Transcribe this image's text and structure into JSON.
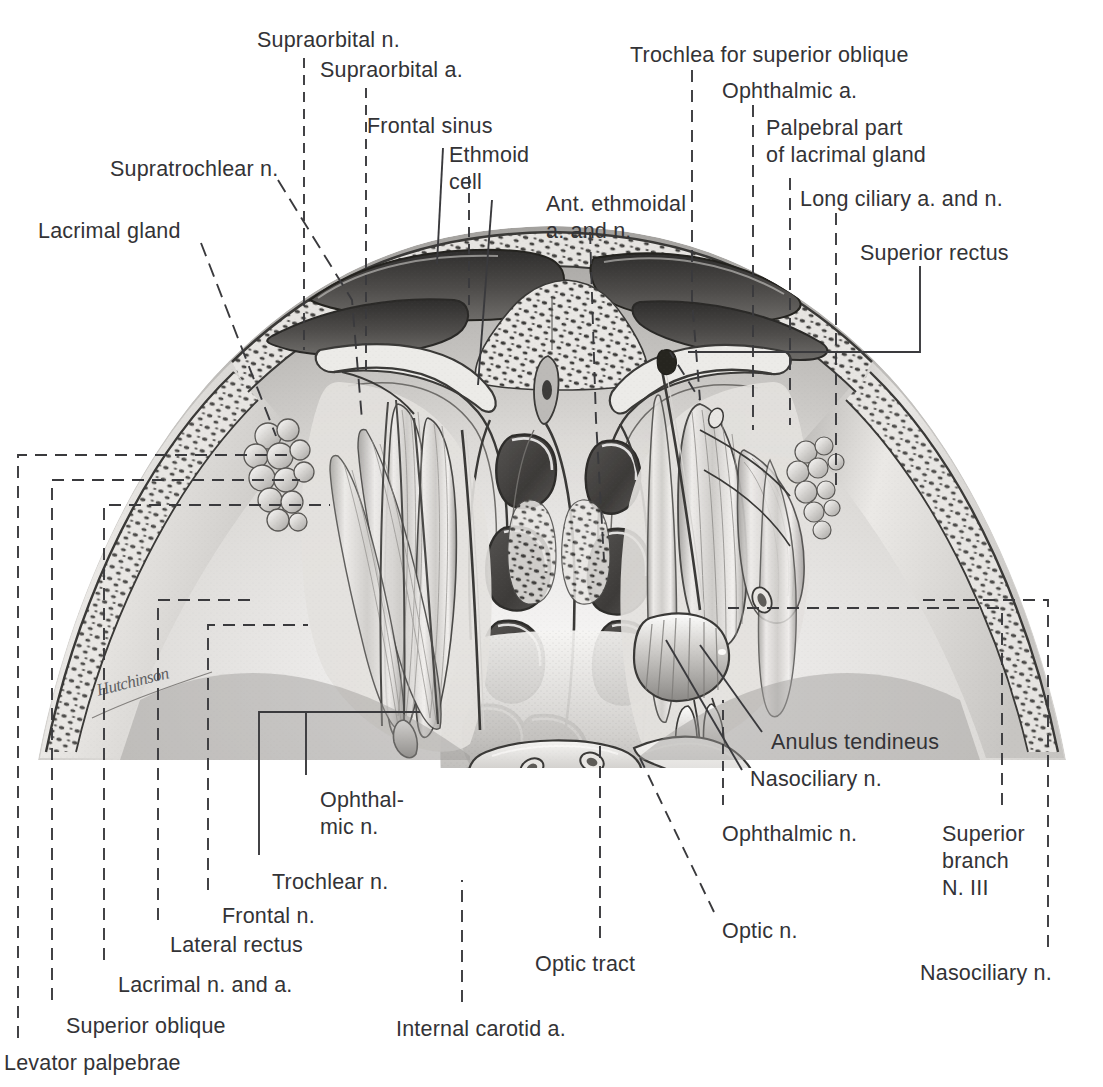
{
  "plate": {
    "title": "Coronal section of the orbits — anatomical plate",
    "artist_signature": "Hutchinson",
    "background_color": "#ffffff",
    "ink_color": "#333336",
    "leader_color": "#3a3a3d"
  },
  "labels": [
    {
      "id": "supraorbital-n",
      "text": "Supraorbital n.",
      "x": 257,
      "y": 27,
      "align": "left"
    },
    {
      "id": "supraorbital-a",
      "text": "Supraorbital a.",
      "x": 320,
      "y": 57,
      "align": "left"
    },
    {
      "id": "frontal-sinus",
      "text": "Frontal sinus",
      "x": 367,
      "y": 113,
      "align": "left"
    },
    {
      "id": "ethmoid-cell",
      "text": "Ethmoid\ncell",
      "x": 449,
      "y": 142,
      "align": "left"
    },
    {
      "id": "supratrochlear-n",
      "text": "Supratrochlear n.",
      "x": 110,
      "y": 156,
      "align": "left"
    },
    {
      "id": "ant-ethmoidal-a-and-n",
      "text": "Ant. ethmoidal\na. and n.",
      "x": 546,
      "y": 191,
      "align": "left"
    },
    {
      "id": "lacrimal-gland",
      "text": "Lacrimal gland",
      "x": 38,
      "y": 218,
      "align": "left"
    },
    {
      "id": "trochlea-superior-oblique",
      "text": "Trochlea for superior oblique",
      "x": 630,
      "y": 42,
      "align": "left"
    },
    {
      "id": "ophthalmic-a",
      "text": "Ophthalmic a.",
      "x": 722,
      "y": 78,
      "align": "left"
    },
    {
      "id": "palpebral-part-lacrimal",
      "text": "Palpebral part\nof lacrimal gland",
      "x": 766,
      "y": 115,
      "align": "left"
    },
    {
      "id": "long-ciliary-a-and-n",
      "text": "Long ciliary a. and n.",
      "x": 800,
      "y": 186,
      "align": "left"
    },
    {
      "id": "superior-rectus",
      "text": "Superior rectus",
      "x": 860,
      "y": 240,
      "align": "left"
    },
    {
      "id": "anulus-tendineus",
      "text": "Anulus tendineus",
      "x": 771,
      "y": 729,
      "align": "left"
    },
    {
      "id": "nasociliary-n-mid",
      "text": "Nasociliary n.",
      "x": 750,
      "y": 766,
      "align": "left"
    },
    {
      "id": "ophthalmic-n-left",
      "text": "Ophthal-\nmic n.",
      "x": 320,
      "y": 787,
      "align": "left"
    },
    {
      "id": "ophthalmic-n-right",
      "text": "Ophthalmic n.",
      "x": 722,
      "y": 821,
      "align": "left"
    },
    {
      "id": "superior-branch-n3",
      "text": "Superior\nbranch\nN. III",
      "x": 942,
      "y": 821,
      "align": "left"
    },
    {
      "id": "trochlear-n",
      "text": "Trochlear n.",
      "x": 272,
      "y": 869,
      "align": "left"
    },
    {
      "id": "frontal-n",
      "text": "Frontal n.",
      "x": 222,
      "y": 903,
      "align": "left"
    },
    {
      "id": "optic-n",
      "text": "Optic n.",
      "x": 722,
      "y": 918,
      "align": "left"
    },
    {
      "id": "lateral-rectus",
      "text": "Lateral rectus",
      "x": 170,
      "y": 932,
      "align": "left"
    },
    {
      "id": "optic-tract",
      "text": "Optic tract",
      "x": 535,
      "y": 951,
      "align": "left"
    },
    {
      "id": "nasociliary-n-bottom",
      "text": "Nasociliary n.",
      "x": 920,
      "y": 960,
      "align": "left"
    },
    {
      "id": "lacrimal-n-and-a",
      "text": "Lacrimal n. and a.",
      "x": 118,
      "y": 972,
      "align": "left"
    },
    {
      "id": "superior-oblique",
      "text": "Superior oblique",
      "x": 66,
      "y": 1013,
      "align": "left"
    },
    {
      "id": "internal-carotid-a",
      "text": "Internal carotid a.",
      "x": 396,
      "y": 1016,
      "align": "left"
    },
    {
      "id": "levator-palpebrae",
      "text": "Levator palpebrae",
      "x": 4,
      "y": 1050,
      "align": "left"
    }
  ],
  "leaders": [
    {
      "id": "leader-supraorbital-n",
      "d": "M 304 58 L 304 350",
      "dash": "10 7"
    },
    {
      "id": "leader-supraorbital-a",
      "d": "M 366 88 L 366 374",
      "dash": "10 7"
    },
    {
      "id": "leader-frontal-sinus",
      "d": "M 443 148 L 437 264",
      "dash": "0"
    },
    {
      "id": "leader-ethmoid-cell-a",
      "d": "M 469 176 L 469 307",
      "dash": "10 7"
    },
    {
      "id": "leader-ethmoid-cell-b",
      "d": "M 492 200 L 478 385",
      "dash": "0"
    },
    {
      "id": "leader-supratrochlear-n",
      "d": "M 278 180 L 352 300 L 362 420",
      "dash": "14 8"
    },
    {
      "id": "leader-lacrimal-gland",
      "d": "M 201 243 L 276 436",
      "dash": "14 8"
    },
    {
      "id": "leader-ant-ethmoidal",
      "d": "M 590 232 L 596 420 L 604 560",
      "dash": "12 8"
    },
    {
      "id": "leader-trochlea",
      "d": "M 692 70 L 692 300 L 700 400 L 670 352",
      "dash": "12 8"
    },
    {
      "id": "leader-ophthalmic-a",
      "d": "M 753 105 L 753 430",
      "dash": "12 8"
    },
    {
      "id": "leader-palpebral-lacrimal",
      "d": "M 790 178 L 790 425",
      "dash": "12 8"
    },
    {
      "id": "leader-long-ciliary",
      "d": "M 836 213 L 836 493",
      "dash": "12 8"
    },
    {
      "id": "leader-superior-rectus",
      "d": "M 920 266 L 920 352 L 688 352",
      "dash": "0"
    },
    {
      "id": "leader-anulus-tendineus",
      "d": "M 762 732 L 700 645",
      "dash": "0"
    },
    {
      "id": "leader-nasociliary-mid",
      "d": "M 742 770 L 666 640",
      "dash": "0"
    },
    {
      "id": "leader-ophthalmic-n-left",
      "d": "M 306 775 L 306 712 L 420 712",
      "dash": "0"
    },
    {
      "id": "leader-ophthalmic-n-right",
      "d": "M 723 805 L 723 700",
      "dash": "10 7"
    },
    {
      "id": "leader-superior-branch-n3",
      "d": "M 1002 805 L 1002 608 L 728 608",
      "dash": "12 8"
    },
    {
      "id": "leader-trochlear-n",
      "d": "M 259 855 L 259 712 L 315 712",
      "dash": "0"
    },
    {
      "id": "leader-frontal-n",
      "d": "M 208 890 L 208 625 L 308 625",
      "dash": "12 8"
    },
    {
      "id": "leader-optic-n",
      "d": "M 714 912 L 640 758",
      "dash": "12 8"
    },
    {
      "id": "leader-lateral-rectus",
      "d": "M 158 920 L 158 600 L 250 600",
      "dash": "12 8"
    },
    {
      "id": "leader-optic-tract",
      "d": "M 600 938 L 600 742",
      "dash": "12 8"
    },
    {
      "id": "leader-nasociliary-bottom",
      "d": "M 1048 947 L 1048 600 L 920 600",
      "dash": "12 8"
    },
    {
      "id": "leader-lacrimal-n-and-a",
      "d": "M 104 960 L 104 505 L 330 505",
      "dash": "12 8"
    },
    {
      "id": "leader-superior-oblique",
      "d": "M 52 1000 L 52 480 L 300 480",
      "dash": "12 8"
    },
    {
      "id": "leader-internal-carotid",
      "d": "M 462 1002 L 462 880",
      "dash": "12 8"
    },
    {
      "id": "leader-levator-palpebrae",
      "d": "M 18 1038 L 18 455 L 290 455",
      "dash": "12 8"
    }
  ],
  "anatomy": {
    "view": "coronal section through both orbits at the level of the optic chiasm",
    "structures": [
      "frontal bone with diploe",
      "frontal sinus (paired cavities)",
      "ethmoid air cells",
      "nasal septum",
      "orbital roof / periorbita",
      "lacrimal gland (left orbit, exposed)",
      "palpebral part of lacrimal gland (right orbit)",
      "levator palpebrae superioris",
      "superior rectus",
      "superior oblique and trochlea",
      "lateral rectus",
      "frontal n., lacrimal n., nasociliary n. (branches of ophthalmic n.)",
      "trochlear n. (N. IV)",
      "ophthalmic a. with long ciliary branches",
      "anterior ethmoidal a. and n.",
      "anulus tendineus (common tendinous ring)",
      "optic n. and optic tract",
      "internal carotid a.",
      "superior branch of N. III"
    ]
  }
}
